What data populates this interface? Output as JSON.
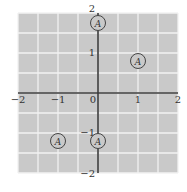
{
  "chart_data": {
    "type": "scatter",
    "title": "",
    "xlabel": "",
    "ylabel": "",
    "xlim": [
      -2,
      2
    ],
    "ylim": [
      -2,
      2
    ],
    "grid": true,
    "grid_step": 0.5,
    "x_ticks": [
      {
        "value": -2,
        "label": "−2"
      },
      {
        "value": -1,
        "label": "−1"
      },
      {
        "value": 0,
        "label": "0"
      },
      {
        "value": 1,
        "label": "1"
      },
      {
        "value": 2,
        "label": "2"
      }
    ],
    "y_ticks": [
      {
        "value": 2,
        "label": "2"
      },
      {
        "value": 1,
        "label": "1"
      },
      {
        "value": -1,
        "label": "−1"
      },
      {
        "value": -2,
        "label": "−2"
      }
    ],
    "series": [
      {
        "name": "A",
        "marker": "circled-letter",
        "points": [
          {
            "x": 0,
            "y": 1.75,
            "label": "A"
          },
          {
            "x": 1,
            "y": 0.8,
            "label": "A"
          },
          {
            "x": -1,
            "y": -1.2,
            "label": "A"
          },
          {
            "x": 0,
            "y": -1.2,
            "label": "A"
          }
        ]
      }
    ],
    "colors": {
      "background": "#c9c9c9",
      "grid": "#f2f2f2",
      "axis": "#3a3a3a",
      "marker": "#444444"
    }
  }
}
